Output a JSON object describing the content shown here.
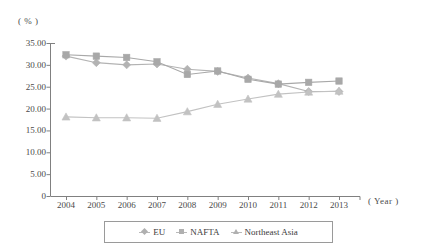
{
  "chart_data": {
    "type": "line",
    "title": "",
    "xlabel": "( Year )",
    "ylabel": "( % )",
    "categories": [
      "2004",
      "2005",
      "2006",
      "2007",
      "2008",
      "2009",
      "2010",
      "2011",
      "2012",
      "2013"
    ],
    "ylim": [
      0,
      35
    ],
    "ytick_labels": [
      "0",
      "5.00",
      "10.00",
      "15.00",
      "20.00",
      "25.00",
      "30.00",
      "35.00"
    ],
    "ytick_values": [
      0,
      5,
      10,
      15,
      20,
      25,
      30,
      35
    ],
    "grid": false,
    "legend_position": "bottom",
    "series": [
      {
        "name": "EU",
        "marker": "diamond",
        "color": "#b3b3b3",
        "values": [
          32.0,
          30.5,
          30.0,
          30.2,
          29.0,
          28.5,
          27.0,
          25.7,
          23.9,
          23.9
        ]
      },
      {
        "name": "NAFTA",
        "marker": "square",
        "color": "#a8a8a8",
        "values": [
          32.3,
          32.0,
          31.7,
          30.7,
          27.8,
          28.6,
          26.7,
          25.6,
          26.0,
          26.3
        ]
      },
      {
        "name": "Northeast Asia",
        "marker": "triangle",
        "color": "#c2c2c2",
        "values": [
          18.1,
          17.9,
          17.9,
          17.8,
          19.3,
          21.0,
          22.2,
          23.3,
          23.8,
          24.0
        ]
      }
    ]
  },
  "axes": {
    "y_unit_label": "( % )",
    "x_unit_label": "( Year )"
  },
  "legend": {
    "items": [
      {
        "label": "EU",
        "marker": "diamond"
      },
      {
        "label": "NAFTA",
        "marker": "square"
      },
      {
        "label": "Northeast Asia",
        "marker": "triangle"
      }
    ]
  },
  "colors": {
    "axis": "#808080",
    "text": "#3b3b3b",
    "eu": "#b3b3b3",
    "nafta": "#a8a8a8",
    "northeast_asia": "#c2c2c2"
  }
}
